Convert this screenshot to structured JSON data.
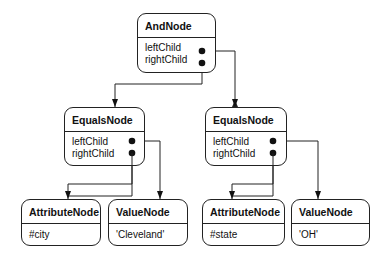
{
  "nodes": {
    "and": {
      "title": "AndNode",
      "fields": [
        "leftChild",
        "rightChild"
      ]
    },
    "equals_left": {
      "title": "EqualsNode",
      "fields": [
        "leftChild",
        "rightChild"
      ]
    },
    "equals_right": {
      "title": "EqualsNode",
      "fields": [
        "leftChild",
        "rightChild"
      ]
    },
    "attr_left": {
      "title": "AttributeNode",
      "fields": [
        "#city"
      ]
    },
    "value_left": {
      "title": "ValueNode",
      "fields": [
        "'Cleveland'"
      ]
    },
    "attr_right": {
      "title": "AttributeNode",
      "fields": [
        "#state"
      ]
    },
    "value_right": {
      "title": "ValueNode",
      "fields": [
        "'OH'"
      ]
    }
  },
  "colors": {
    "line": "#222222",
    "background": "#ffffff"
  }
}
